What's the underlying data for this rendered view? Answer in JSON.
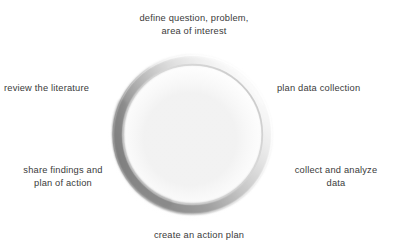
{
  "diagram": {
    "type": "cycle-ring",
    "center_shape": "ring-torus",
    "colors": {
      "background": "#ffffff",
      "text": "#3a3a3a",
      "ring_dark": "#8a8a8a",
      "ring_mid": "#b8b8b8",
      "ring_light": "#f2f2f2",
      "ring_shadow": "#d9d9d9"
    },
    "steps": [
      {
        "id": "define-question",
        "position": "top",
        "label": "define question, problem,\narea of interest"
      },
      {
        "id": "plan-data-collection",
        "position": "upper-right",
        "label": "plan data collection"
      },
      {
        "id": "collect-and-analyze-data",
        "position": "lower-right",
        "label": "collect and analyze\ndata"
      },
      {
        "id": "create-an-action-plan",
        "position": "bottom",
        "label": "create an action plan"
      },
      {
        "id": "share-findings",
        "position": "lower-left",
        "label": "share findings and\nplan of action"
      },
      {
        "id": "review-the-literature",
        "position": "upper-left",
        "label": "review the literature"
      }
    ]
  }
}
